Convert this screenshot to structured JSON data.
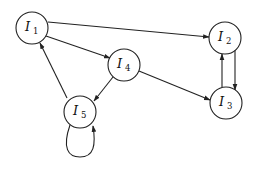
{
  "diagram": {
    "type": "directed-graph",
    "nodes": [
      {
        "id": "I1",
        "letter": "I",
        "sub": "1",
        "cx": 32,
        "cy": 28
      },
      {
        "id": "I2",
        "letter": "I",
        "sub": "2",
        "cx": 225,
        "cy": 38
      },
      {
        "id": "I3",
        "letter": "I",
        "sub": "3",
        "cx": 226,
        "cy": 103
      },
      {
        "id": "I4",
        "letter": "I",
        "sub": "4",
        "cx": 124,
        "cy": 65
      },
      {
        "id": "I5",
        "letter": "I",
        "sub": "5",
        "cx": 80,
        "cy": 112
      }
    ],
    "edges": [
      {
        "from": "I1",
        "to": "I2"
      },
      {
        "from": "I1",
        "to": "I4"
      },
      {
        "from": "I4",
        "to": "I3"
      },
      {
        "from": "I4",
        "to": "I5"
      },
      {
        "from": "I5",
        "to": "I1"
      },
      {
        "from": "I3",
        "to": "I2"
      },
      {
        "from": "I2",
        "to": "I3"
      },
      {
        "from": "I5",
        "to": "I5"
      }
    ],
    "node_radius": 16
  }
}
